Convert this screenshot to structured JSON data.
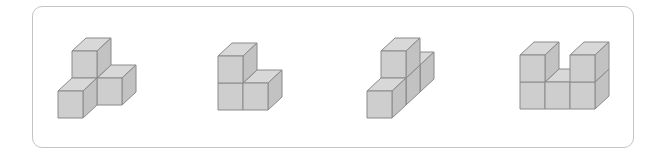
{
  "panel": {
    "border_color": "#c4c4c4"
  },
  "cube_style": {
    "width": 25,
    "height": 27,
    "depth_dx": 14,
    "depth_dy": -13,
    "top_color": "#d8d8d8",
    "front_color": "#cecece",
    "side_color": "#c2c2c2",
    "edge_color": "#8a8a8a"
  },
  "figures": [
    {
      "name": "figure-1",
      "origin": [
        72,
        78
      ],
      "cubes": [
        [
          0,
          0,
          0
        ],
        [
          0,
          1,
          0
        ],
        [
          1,
          0,
          0
        ],
        [
          0,
          0,
          -1
        ]
      ]
    },
    {
      "name": "figure-2",
      "origin": [
        218,
        83
      ],
      "cubes": [
        [
          0,
          0,
          0
        ],
        [
          0,
          1,
          0
        ],
        [
          1,
          0,
          0
        ]
      ]
    },
    {
      "name": "figure-3",
      "origin": [
        367,
        91
      ],
      "cubes": [
        [
          0,
          0,
          0
        ],
        [
          0,
          0,
          1
        ],
        [
          0,
          0,
          2
        ],
        [
          0,
          1,
          1
        ]
      ]
    },
    {
      "name": "figure-4",
      "origin": [
        520,
        82
      ],
      "cubes": [
        [
          0,
          0,
          0
        ],
        [
          1,
          0,
          0
        ],
        [
          2,
          0,
          0
        ],
        [
          0,
          1,
          0
        ],
        [
          2,
          1,
          0
        ]
      ]
    }
  ]
}
